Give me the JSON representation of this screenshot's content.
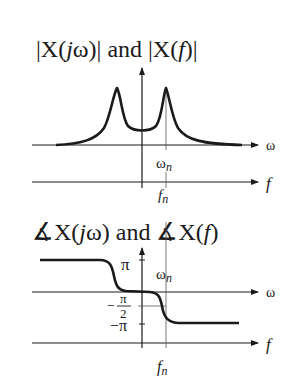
{
  "magnitude_plot": {
    "title_parts": [
      "|X(",
      "j",
      "ω)| and |X(",
      "f",
      ")|"
    ],
    "axis_omega_label": "ω",
    "axis_f_label": "f",
    "omega_n_label": "ω",
    "omega_n_sub": "n",
    "f_n_label": "f",
    "f_n_sub": "n"
  },
  "phase_plot": {
    "title_parts": [
      "∡X(",
      "j",
      "ω) and ∡X(",
      "f",
      ")"
    ],
    "axis_omega_label": "ω",
    "axis_f_label": "f",
    "pi_label": "π",
    "neg_half_pi_num": "π",
    "neg_half_pi_den": "2",
    "neg_half_pi_minus": "−",
    "neg_pi_label": "−π",
    "omega_n_label": "ω",
    "omega_n_sub": "n",
    "f_n_label": "f",
    "f_n_sub": "n"
  },
  "colors": {
    "ink": "#1a1a1a",
    "guide": "#555555"
  }
}
